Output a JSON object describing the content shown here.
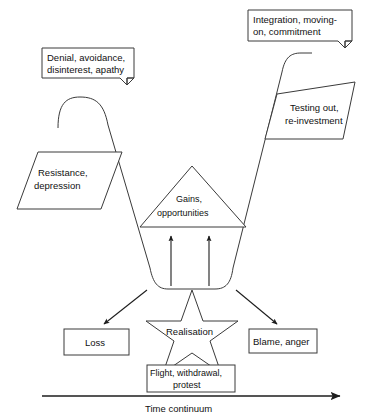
{
  "diagram": {
    "axis": {
      "label": "Time continuum",
      "arrow_direction": "right"
    },
    "colors": {
      "stroke": "#3a3a3a",
      "arrow": "#1d1d1d",
      "background": "#ffffff",
      "text": "#111111"
    },
    "callouts": [
      {
        "id": "denial-callout",
        "name": "denial-callout",
        "line1": "Denial, avoidance,",
        "line2": "disinterest, apathy"
      },
      {
        "id": "integration-callout",
        "name": "integration-callout",
        "line1": "Integration, moving-",
        "line2": "on, commitment"
      }
    ],
    "parallelograms": [
      {
        "id": "resistance-parallelogram",
        "line1": "Resistance,",
        "line2": "depression"
      },
      {
        "id": "testing-parallelogram",
        "line1": "Testing out,",
        "line2": "re-investment"
      }
    ],
    "triangle": {
      "id": "gains-triangle",
      "line1": "Gains,",
      "line2": "opportunities"
    },
    "star": {
      "id": "realisation-star",
      "label": "Realisation"
    },
    "boxes": [
      {
        "id": "loss-box",
        "label": "Loss"
      },
      {
        "id": "blame-box",
        "label": "Blame, anger"
      },
      {
        "id": "flight-box",
        "line1": "Flight, withdrawal,",
        "line2": "protest"
      }
    ]
  }
}
